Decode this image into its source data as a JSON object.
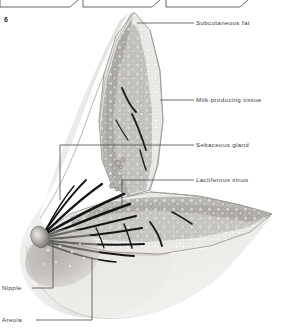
{
  "figure": {
    "number": "6"
  },
  "caption_boxes": [
    {
      "id": "box-1",
      "label": ""
    },
    {
      "id": "box-2",
      "label": ""
    },
    {
      "id": "box-3",
      "label": ""
    }
  ],
  "labels": {
    "subcutaneous_fat": "Subcutaneous fat",
    "milk_producing_tissue": "Milk-producing tissue",
    "sebaceous_gland": "Sebaceous gland",
    "lactiferous_sinus": "Lactiferous sinus",
    "nipple": "Nipple",
    "areola": "Areola"
  },
  "colors": {
    "line": "#4a4a4a",
    "text": "#3a3a3a",
    "skin_light": "#efeeec",
    "skin_mid": "#dedcd9",
    "skin_shadow": "#c9c6c2",
    "fat_stipple": "#e2e0dd",
    "gland_dark": "#9a9893",
    "gland_mid": "#b5b3ae",
    "duct": "#1c1c1c",
    "nipple_dark": "#6d6a66"
  }
}
